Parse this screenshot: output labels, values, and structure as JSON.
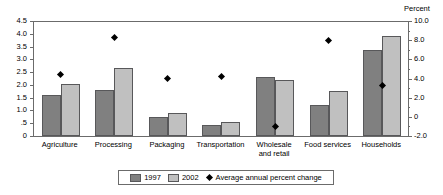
{
  "chart_data": {
    "type": "bar",
    "title": "",
    "subtitle": "",
    "xlabel": "",
    "ylabel": "",
    "secondary_axis_title": "Percent",
    "grid": false,
    "legend_position": "bottom",
    "categories": [
      "Agriculture",
      "Processing",
      "Packaging",
      "Transportation",
      "Wholesale and retail",
      "Food services",
      "Households"
    ],
    "category_lines": [
      [
        "Agriculture"
      ],
      [
        "Processing"
      ],
      [
        "Packaging"
      ],
      [
        "Transportation"
      ],
      [
        "Wholesale",
        "and retail"
      ],
      [
        "Food services"
      ],
      [
        "Households"
      ]
    ],
    "series": [
      {
        "name": "1997",
        "type": "bar",
        "axis": "left",
        "color": "#808080",
        "values": [
          1.6,
          1.8,
          0.75,
          0.45,
          2.3,
          1.2,
          3.35
        ]
      },
      {
        "name": "2002",
        "type": "bar",
        "axis": "left",
        "color": "#c0c0c0",
        "values": [
          2.05,
          2.65,
          0.9,
          0.55,
          2.18,
          1.78,
          3.92
        ]
      },
      {
        "name": "Average annual percent change",
        "type": "scatter",
        "axis": "right",
        "color": "#000000",
        "marker": "diamond",
        "values": [
          4.4,
          8.3,
          4.0,
          4.2,
          -1.0,
          8.0,
          3.3
        ]
      }
    ],
    "ylim": [
      0,
      4.5
    ],
    "yticks": [
      0,
      0.5,
      1.0,
      1.5,
      2.0,
      2.5,
      3.0,
      3.5,
      4.0,
      4.5
    ],
    "ytick_labels": [
      "0",
      ".5",
      "1.0",
      "1.5",
      "2.0",
      "2.5",
      "3.0",
      "3.5",
      "4.0",
      "4.5"
    ],
    "ylim_right": [
      -2.0,
      10.0
    ],
    "yticks_right": [
      -2.0,
      0,
      2.0,
      4.0,
      6.0,
      8.0,
      10.0
    ],
    "ytick_labels_right": [
      "-2.0",
      "0",
      "2.0",
      "4.0",
      "6.0",
      "8.0",
      "10.0"
    ]
  },
  "legend": {
    "items": [
      {
        "label": "1997",
        "marker": "swatch-dark"
      },
      {
        "label": "2002",
        "marker": "swatch-light"
      },
      {
        "label": "Average annual percent change",
        "marker": "diamond"
      }
    ]
  }
}
